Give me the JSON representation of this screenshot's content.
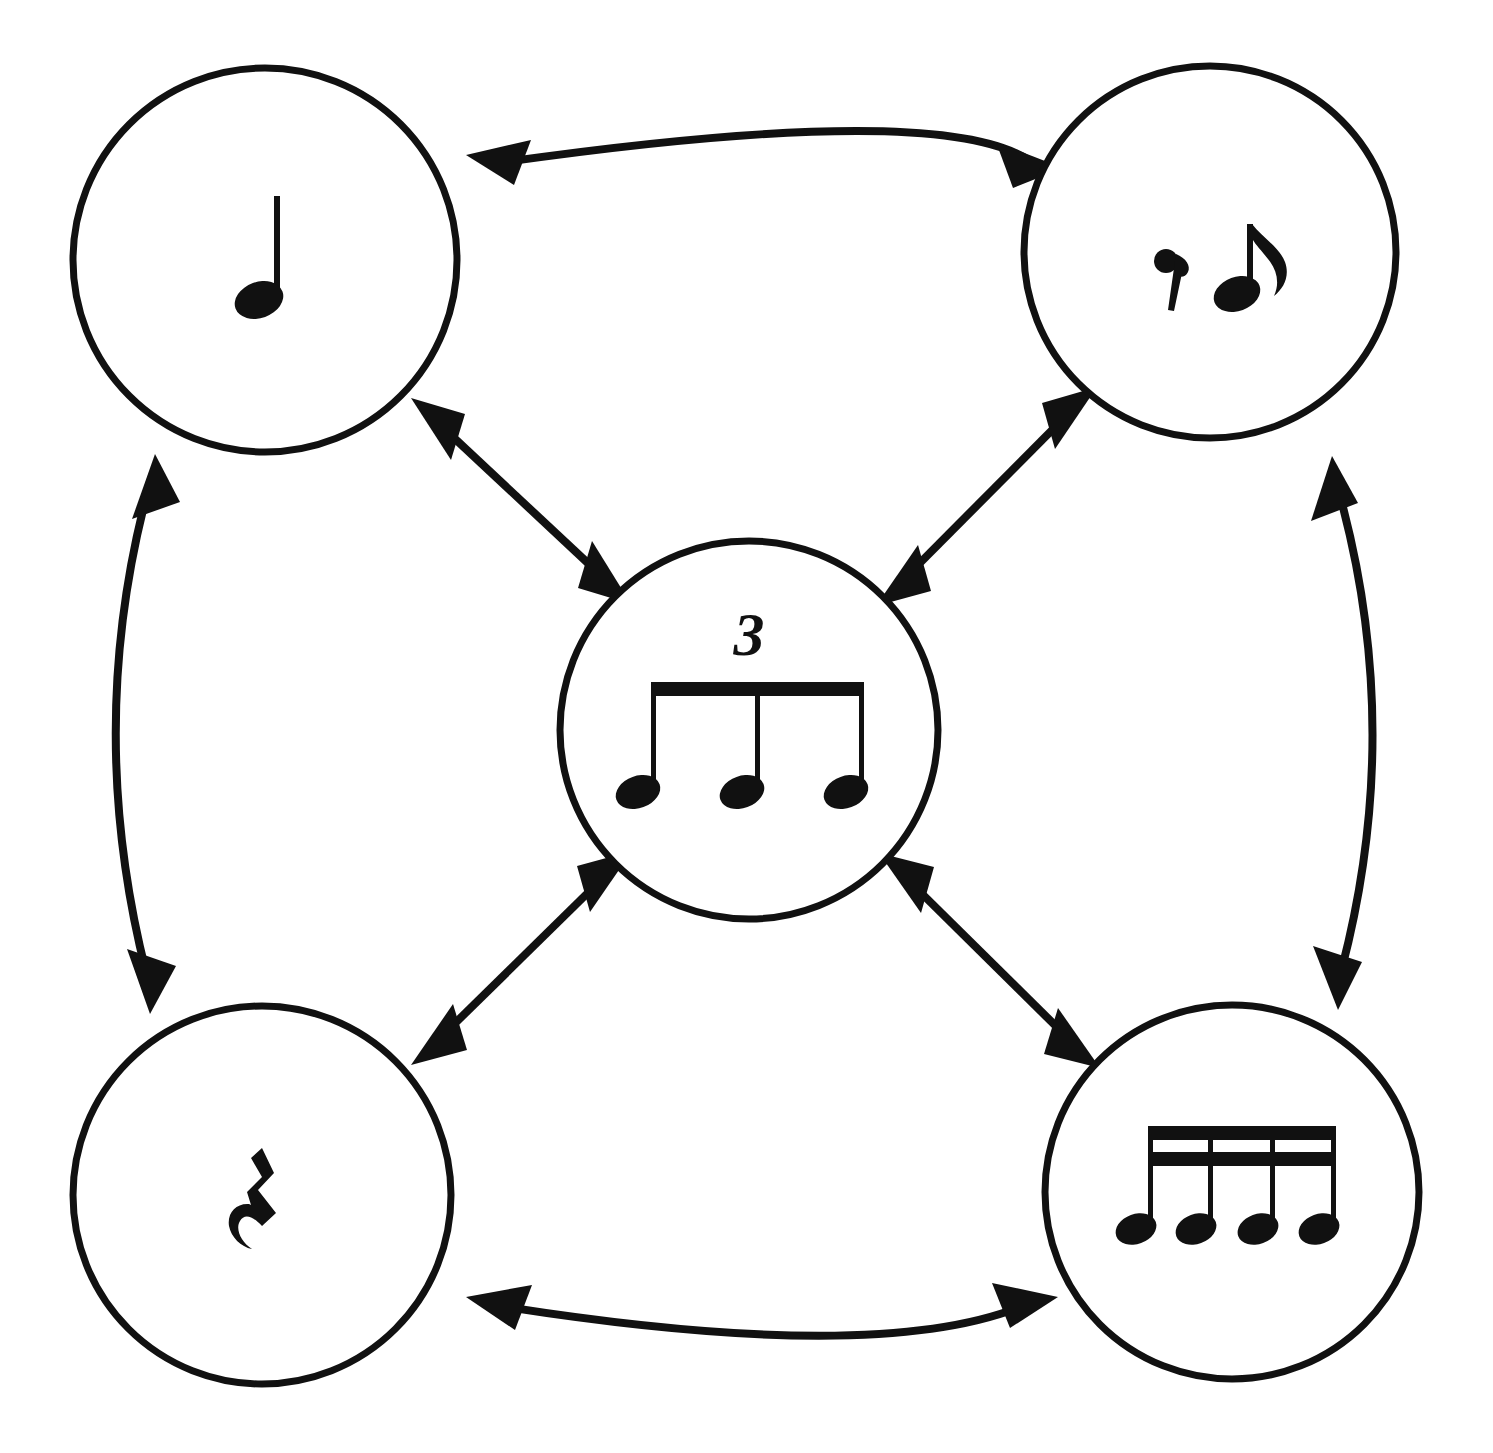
{
  "diagram": {
    "type": "node-link-diagram",
    "background_color": "#ffffff",
    "stroke_color": "#111111",
    "node_count": 5,
    "edge_count": 8,
    "nodes": [
      {
        "id": "quarter-note",
        "position": "top-left",
        "label": "quarter note",
        "music_symbol": "♩",
        "icon_name": "quarter-note-icon",
        "cx": 265,
        "cy": 260,
        "r": 192
      },
      {
        "id": "eighth-rest-eighth-note",
        "position": "top-right",
        "label": "eighth rest and eighth note",
        "music_symbol": "𝄾 ♪",
        "icon_name": "eighth-rest-eighth-note-icon",
        "cx": 1210,
        "cy": 252,
        "r": 186
      },
      {
        "id": "eighth-note-triplet",
        "position": "center",
        "label": "eighth note triplet",
        "music_symbol": "♫♪",
        "icon_name": "eighth-note-triplet-icon",
        "tuplet_numeral": "3",
        "cx": 749,
        "cy": 730,
        "r": 189
      },
      {
        "id": "quarter-rest",
        "position": "bottom-left",
        "label": "quarter rest",
        "music_symbol": "𝄽",
        "icon_name": "quarter-rest-icon",
        "cx": 262,
        "cy": 1195,
        "r": 189
      },
      {
        "id": "four-sixteenth-notes",
        "position": "bottom-right",
        "label": "four beamed sixteenth notes",
        "music_symbol": "♬♬",
        "icon_name": "sixteenth-notes-icon",
        "cx": 1232,
        "cy": 1192,
        "r": 187
      }
    ],
    "edges": [
      {
        "id": "edge-top",
        "from": "quarter-note",
        "to": "eighth-rest-eighth-note",
        "style": "curved",
        "bow": "outward-up",
        "heads": "both",
        "label": ""
      },
      {
        "id": "edge-left",
        "from": "quarter-note",
        "to": "quarter-rest",
        "style": "curved",
        "bow": "outward-left",
        "heads": "both",
        "label": ""
      },
      {
        "id": "edge-right",
        "from": "eighth-rest-eighth-note",
        "to": "four-sixteenth-notes",
        "style": "curved",
        "bow": "outward-right",
        "heads": "both",
        "label": ""
      },
      {
        "id": "edge-bottom",
        "from": "quarter-rest",
        "to": "four-sixteenth-notes",
        "style": "curved",
        "bow": "outward-down",
        "heads": "both",
        "label": ""
      },
      {
        "id": "edge-topleft-center",
        "from": "quarter-note",
        "to": "eighth-note-triplet",
        "style": "straight",
        "heads": "both",
        "label": ""
      },
      {
        "id": "edge-topright-center",
        "from": "eighth-rest-eighth-note",
        "to": "eighth-note-triplet",
        "style": "straight",
        "heads": "both",
        "label": ""
      },
      {
        "id": "edge-bottomleft-center",
        "from": "quarter-rest",
        "to": "eighth-note-triplet",
        "style": "straight",
        "heads": "both",
        "label": ""
      },
      {
        "id": "edge-bottomright-center",
        "from": "four-sixteenth-notes",
        "to": "eighth-note-triplet",
        "style": "straight",
        "heads": "both",
        "label": ""
      }
    ]
  }
}
